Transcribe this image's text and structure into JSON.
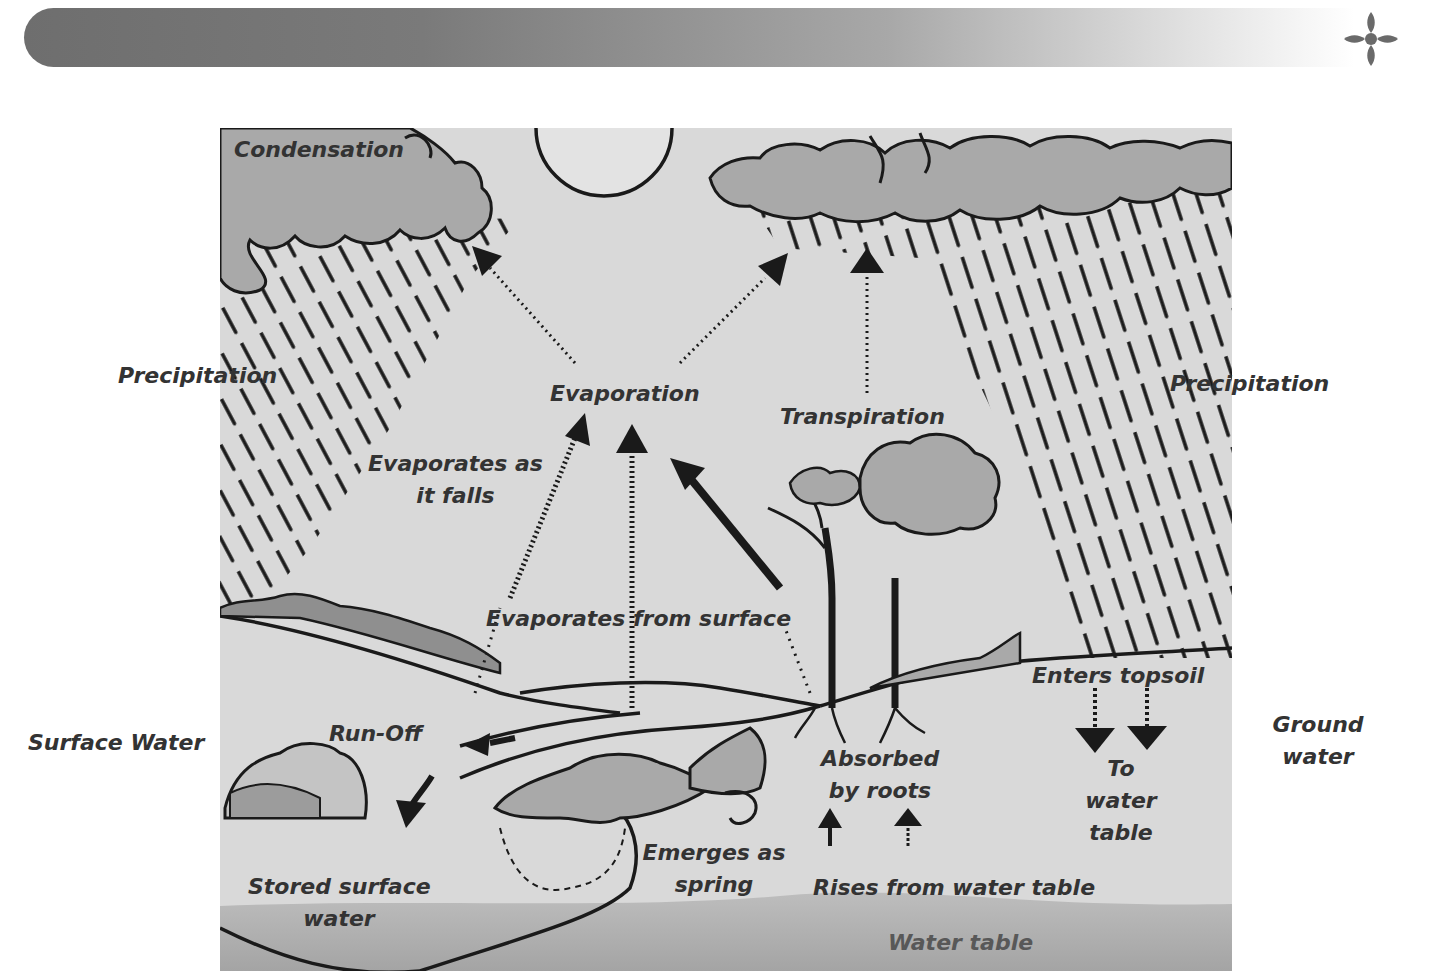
{
  "header": {
    "bar_gradient": [
      "#6e6e6e",
      "#a8a8a8",
      "#ffffff"
    ],
    "ornament": "four-petal-flower-icon",
    "ornament_color": "#6a6a6a"
  },
  "diagram": {
    "background_color": "#d9d9d9",
    "cloud_color": "#a9a9a9",
    "line_color": "#1a1a1a",
    "labels": {
      "condensation": "Condensation",
      "precipitation_left": "Precipitation",
      "precipitation_right": "Precipitation",
      "evaporation": "Evaporation",
      "transpiration": "Transpiration",
      "evaporates_as_line1": "Evaporates as",
      "evaporates_as_line2": "it falls",
      "evaporates_from_surface": "Evaporates from surface",
      "surface_water": "Surface Water",
      "run_off": "Run-Off",
      "enters_topsoil": "Enters topsoil",
      "ground_water_line1": "Ground",
      "ground_water_line2": "water",
      "absorbed_line1": "Absorbed",
      "absorbed_line2": "by roots",
      "to_water_table_line1": "To",
      "to_water_table_line2": "water",
      "to_water_table_line3": "table",
      "emerges_line1": "Emerges as",
      "emerges_line2": "spring",
      "rises_from_water_table": "Rises from water table",
      "stored_line1": "Stored surface",
      "stored_line2": "water",
      "water_table": "Water table"
    },
    "elements": [
      "sun",
      "left-cloud",
      "right-cloud",
      "rain",
      "trees",
      "hills",
      "pond",
      "spring",
      "arrows"
    ]
  }
}
